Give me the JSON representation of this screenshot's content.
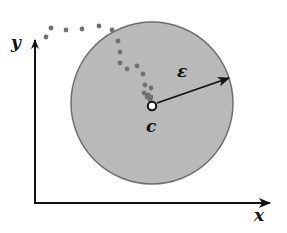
{
  "diagram": {
    "type": "convergence-neighborhood",
    "axes": {
      "x_label": "x",
      "y_label": "y"
    },
    "neighborhood": {
      "center_label": "c",
      "radius_label": "ε",
      "fill_color": "#b9b9b9",
      "edge_color": "#6e6e6e",
      "center_px": [
        152,
        103
      ],
      "radius_px": 81
    },
    "sequence_points_px": [
      [
        46,
        37
      ],
      [
        51,
        28
      ],
      [
        66,
        30
      ],
      [
        82,
        29
      ],
      [
        99,
        26
      ],
      [
        112,
        30
      ],
      [
        118,
        41
      ],
      [
        120,
        52
      ],
      [
        120,
        63
      ],
      [
        127,
        69
      ],
      [
        137,
        66
      ],
      [
        143,
        74
      ],
      [
        145,
        85
      ],
      [
        151,
        88
      ],
      [
        144,
        93
      ],
      [
        148,
        95
      ],
      [
        151,
        97
      ],
      [
        147,
        97
      ],
      [
        150,
        100
      ]
    ],
    "colors": {
      "axis": "#111111",
      "dot": "#707070",
      "arrow": "#111111"
    }
  }
}
